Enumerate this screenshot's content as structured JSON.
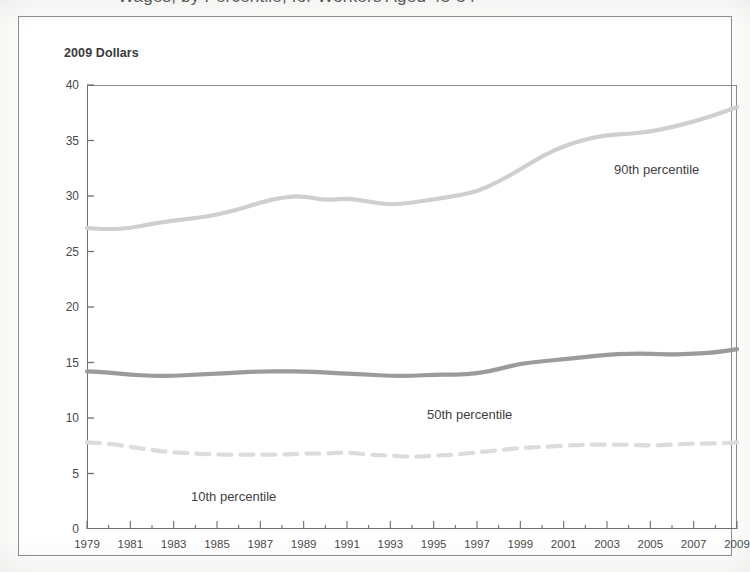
{
  "figure": {
    "clipped_title": "Wages, by Percentile, for Workers Aged 45-54",
    "axis_caption": "2009 Dollars"
  },
  "chart_data": {
    "type": "line",
    "title": "2009 Dollars",
    "xlabel": "",
    "ylabel": "2009 Dollars",
    "xlim": [
      1979,
      2009
    ],
    "ylim": [
      0,
      40
    ],
    "grid": false,
    "legend_position": "inline-annotations",
    "yticks": [
      0,
      5,
      10,
      15,
      20,
      25,
      30,
      35,
      40
    ],
    "ytick_labels": [
      "0",
      "5",
      "10",
      "15",
      "20",
      "25",
      "30",
      "35",
      "40"
    ],
    "xticks": [
      1979,
      1981,
      1983,
      1985,
      1987,
      1989,
      1991,
      1993,
      1995,
      1997,
      1999,
      2001,
      2003,
      2005,
      2007,
      2009
    ],
    "xtick_labels": [
      "1979",
      "1981",
      "1983",
      "1985",
      "1987",
      "1989",
      "1991",
      "1993",
      "1995",
      "1997",
      "1999",
      "2001",
      "2003",
      "2005",
      "2007",
      "2009"
    ],
    "x": [
      1979,
      1980,
      1981,
      1982,
      1983,
      1984,
      1985,
      1986,
      1987,
      1988,
      1989,
      1990,
      1991,
      1992,
      1993,
      1994,
      1995,
      1996,
      1997,
      1998,
      1999,
      2000,
      2001,
      2002,
      2003,
      2004,
      2005,
      2006,
      2007,
      2008,
      2009
    ],
    "series": [
      {
        "name": "90th percentile",
        "color": "#cfcfcf",
        "style": "solid",
        "width": 4.2,
        "label_text": "90th percentile",
        "values": [
          27.1,
          27.0,
          27.1,
          27.5,
          27.8,
          28.0,
          28.3,
          28.8,
          29.4,
          29.9,
          30.0,
          29.6,
          29.8,
          29.5,
          29.2,
          29.4,
          29.7,
          30.0,
          30.4,
          31.3,
          32.4,
          33.6,
          34.5,
          35.1,
          35.5,
          35.6,
          35.8,
          36.2,
          36.7,
          37.3,
          38.0
        ]
      },
      {
        "name": "50th percentile",
        "color": "#9b9b9b",
        "style": "solid",
        "width": 4.2,
        "label_text": "50th percentile",
        "values": [
          14.2,
          14.1,
          13.9,
          13.8,
          13.8,
          13.9,
          14.0,
          14.1,
          14.2,
          14.2,
          14.2,
          14.1,
          14.0,
          13.9,
          13.8,
          13.8,
          13.9,
          13.9,
          14.0,
          14.4,
          14.9,
          15.1,
          15.3,
          15.5,
          15.7,
          15.8,
          15.8,
          15.7,
          15.8,
          15.9,
          16.2
        ]
      },
      {
        "name": "10th percentile",
        "color": "#dcdcdc",
        "style": "dashed",
        "width": 4.2,
        "label_text": "10th percentile",
        "values": [
          7.8,
          7.7,
          7.4,
          7.1,
          6.9,
          6.8,
          6.7,
          6.7,
          6.7,
          6.7,
          6.8,
          6.8,
          6.9,
          6.7,
          6.6,
          6.5,
          6.6,
          6.7,
          6.9,
          7.1,
          7.3,
          7.4,
          7.5,
          7.6,
          7.6,
          7.6,
          7.5,
          7.6,
          7.7,
          7.7,
          7.8
        ]
      }
    ]
  }
}
